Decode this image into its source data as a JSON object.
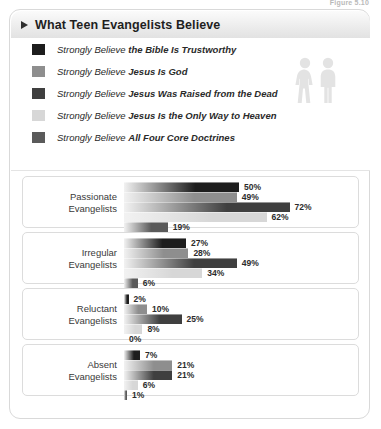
{
  "figure_label": "Figure 5.10",
  "header": {
    "title": "What Teen Evangelists Believe",
    "arrow_icon": "triangle-right-icon"
  },
  "legend": {
    "prefix": "Strongly Believe",
    "items": [
      {
        "prefix": "Strongly Believe ",
        "emphasis": "the Bible Is Trustworthy",
        "color": "#1d1d1d"
      },
      {
        "prefix": "Strongly Believe ",
        "emphasis": "Jesus Is God",
        "color": "#8e8e8e"
      },
      {
        "prefix": "Strongly Believe ",
        "emphasis": "Jesus Was Raised from the Dead",
        "color": "#3f3f3f"
      },
      {
        "prefix": "Strongly Believe ",
        "emphasis": "Jesus Is the Only Way to Heaven",
        "color": "#d7d7d7"
      },
      {
        "prefix": "Strongly Believe ",
        "emphasis": "All Four Core Doctrines",
        "color": "#5a5a5a"
      }
    ],
    "watermark_icon": "two-people-icon"
  },
  "chart_data": {
    "type": "bar",
    "orientation": "horizontal",
    "title": "What Teen Evangelists Believe",
    "xlabel": "",
    "ylabel": "",
    "xlim": [
      0,
      100
    ],
    "grid": false,
    "legend_position": "top",
    "value_suffix": "%",
    "categories": [
      "Passionate Evangelists",
      "Irregular Evangelists",
      "Reluctant Evangelists",
      "Absent Evangelists"
    ],
    "series": [
      {
        "name": "Strongly Believe the Bible Is Trustworthy",
        "color": "#1d1d1d",
        "values": [
          50,
          27,
          2,
          7
        ]
      },
      {
        "name": "Strongly Believe Jesus Is God",
        "color": "#8e8e8e",
        "values": [
          49,
          28,
          10,
          21
        ]
      },
      {
        "name": "Strongly Believe Jesus Was Raised from the Dead",
        "color": "#3f3f3f",
        "values": [
          72,
          49,
          25,
          21
        ]
      },
      {
        "name": "Strongly Believe Jesus Is the Only Way to Heaven",
        "color": "#d7d7d7",
        "values": [
          62,
          34,
          8,
          6
        ]
      },
      {
        "name": "Strongly Believe All Four Core Doctrines",
        "color": "#5a5a5a",
        "values": [
          19,
          6,
          0,
          1
        ]
      }
    ],
    "groups": [
      {
        "label_line1": "Passionate",
        "label_line2": "Evangelists",
        "bars": [
          {
            "value": 50,
            "label": "50%",
            "color": "#1d1d1d"
          },
          {
            "value": 49,
            "label": "49%",
            "color": "#8e8e8e"
          },
          {
            "value": 72,
            "label": "72%",
            "color": "#3f3f3f"
          },
          {
            "value": 62,
            "label": "62%",
            "color": "#d7d7d7"
          },
          {
            "value": 19,
            "label": "19%",
            "color": "#5a5a5a"
          }
        ]
      },
      {
        "label_line1": "Irregular",
        "label_line2": "Evangelists",
        "bars": [
          {
            "value": 27,
            "label": "27%",
            "color": "#1d1d1d"
          },
          {
            "value": 28,
            "label": "28%",
            "color": "#8e8e8e"
          },
          {
            "value": 49,
            "label": "49%",
            "color": "#3f3f3f"
          },
          {
            "value": 34,
            "label": "34%",
            "color": "#d7d7d7"
          },
          {
            "value": 6,
            "label": "6%",
            "color": "#5a5a5a"
          }
        ]
      },
      {
        "label_line1": "Reluctant",
        "label_line2": "Evangelists",
        "bars": [
          {
            "value": 2,
            "label": "2%",
            "color": "#1d1d1d"
          },
          {
            "value": 10,
            "label": "10%",
            "color": "#8e8e8e"
          },
          {
            "value": 25,
            "label": "25%",
            "color": "#3f3f3f"
          },
          {
            "value": 8,
            "label": "8%",
            "color": "#d7d7d7"
          },
          {
            "value": 0,
            "label": "0%",
            "color": "#5a5a5a"
          }
        ]
      },
      {
        "label_line1": "Absent",
        "label_line2": "Evangelists",
        "bars": [
          {
            "value": 7,
            "label": "7%",
            "color": "#1d1d1d"
          },
          {
            "value": 21,
            "label": "21%",
            "color": "#8e8e8e"
          },
          {
            "value": 21,
            "label": "21%",
            "color": "#3f3f3f"
          },
          {
            "value": 6,
            "label": "6%",
            "color": "#d7d7d7"
          },
          {
            "value": 1,
            "label": "1%",
            "color": "#5a5a5a"
          }
        ]
      }
    ]
  }
}
